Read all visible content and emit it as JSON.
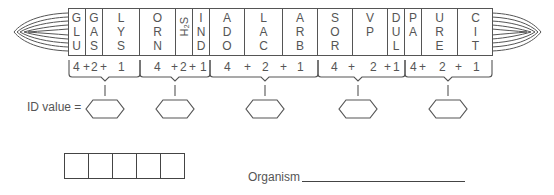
{
  "diagram": {
    "type": "API 20E identification strip worksheet",
    "tests": [
      {
        "code": "GLU",
        "letters": [
          "G",
          "L",
          "U"
        ],
        "group": 1,
        "weight": 4
      },
      {
        "code": "GAS",
        "letters": [
          "G",
          "A",
          "S"
        ],
        "group": 1,
        "weight": 2
      },
      {
        "code": "LYS",
        "letters": [
          "L",
          "Y",
          "S"
        ],
        "group": 1,
        "weight": 1
      },
      {
        "code": "ORN",
        "letters": [
          "O",
          "R",
          "N"
        ],
        "group": 2,
        "weight": 4
      },
      {
        "code": "H2S",
        "letters": [
          "H₂S"
        ],
        "group": 2,
        "weight": 2
      },
      {
        "code": "IND",
        "letters": [
          "I",
          "N",
          "D"
        ],
        "group": 2,
        "weight": 1
      },
      {
        "code": "ADO",
        "letters": [
          "A",
          "D",
          "O"
        ],
        "group": 3,
        "weight": 4
      },
      {
        "code": "LAC",
        "letters": [
          "L",
          "A",
          "C"
        ],
        "group": 3,
        "weight": 2
      },
      {
        "code": "ARB",
        "letters": [
          "A",
          "R",
          "B"
        ],
        "group": 3,
        "weight": 1
      },
      {
        "code": "SOR",
        "letters": [
          "S",
          "O",
          "R"
        ],
        "group": 4,
        "weight": 4
      },
      {
        "code": "VP",
        "letters": [
          "V",
          "P"
        ],
        "group": 4,
        "weight": 2
      },
      {
        "code": "DUL",
        "letters": [
          "D",
          "U",
          "L"
        ],
        "group": 4,
        "weight": 1
      },
      {
        "code": "PA",
        "letters": [
          "P",
          "A"
        ],
        "group": 5,
        "weight": 4
      },
      {
        "code": "URE",
        "letters": [
          "U",
          "R",
          "E"
        ],
        "group": 5,
        "weight": 2
      },
      {
        "code": "CIT",
        "letters": [
          "C",
          "I",
          "T"
        ],
        "group": 5,
        "weight": 1
      }
    ],
    "brace_labels": {
      "g1": [
        "4",
        "+",
        "2",
        "+",
        "1"
      ],
      "g2": [
        "4",
        "+",
        "2",
        "+",
        "1"
      ],
      "g3": [
        "4",
        "+",
        "2",
        "+",
        "1"
      ],
      "g4": [
        "4",
        "+",
        "2",
        "+",
        "1"
      ],
      "g5": [
        "4",
        "+",
        "2",
        "+",
        "1"
      ]
    },
    "id_value_label": "ID value =",
    "id_value_boxes": 5,
    "result_boxes": 5,
    "organism_label": "Organism"
  }
}
